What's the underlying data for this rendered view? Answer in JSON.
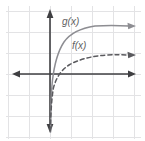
{
  "figure": {
    "width": 145,
    "height": 141,
    "background_color": "#ffffff"
  },
  "grid": {
    "visible": true,
    "color": "#e3e3e5",
    "spacing_px": 21,
    "x_lines": [
      8,
      29,
      50,
      71,
      92,
      113,
      134
    ],
    "y_lines": [
      11,
      32,
      53,
      74,
      95,
      116,
      137
    ]
  },
  "axes": {
    "color": "#3f3f42",
    "origin": {
      "x": 50,
      "y": 74
    },
    "x_axis": {
      "from_x": 12,
      "to_x": 136,
      "y": 74,
      "arrows": "both"
    },
    "y_axis": {
      "from_y": 8,
      "to_y": 132,
      "x": 50,
      "arrows": "both"
    },
    "tick_labels": []
  },
  "curves": [
    {
      "name": "g",
      "label": "g(x)",
      "label_x": 62,
      "label_y": 25,
      "style": "solid",
      "color": "#8d8d92",
      "arrow_end": "right",
      "description": "logarithmic curve, steep rise near x=0, flattening to the right",
      "path": "M 50.6 132 C 50.8 110, 51.2 92, 52.4 81 C 54.2 65, 58 51, 64 42 C 71 32, 82 28, 95 26 C 108 25, 120 25.4, 129 26"
    },
    {
      "name": "f",
      "label": "f(x)",
      "label_x": 72,
      "label_y": 49,
      "style": "dashed",
      "color": "#5a5a5e",
      "arrow_end": "right",
      "description": "logarithmic curve with smaller base-scale, shallower than g(x)",
      "path": "M 50.4 131 C 50.6 116, 51.4 100, 53.4 88 C 56 78, 61 70, 69 65 C 79 59, 93 56, 107 55 C 116 54.6, 124 54.8, 129 55"
    }
  ],
  "chart_data": {
    "type": "line",
    "title": "",
    "xlabel": "",
    "ylabel": "",
    "xlim": [
      -2,
      4
    ],
    "ylim": [
      -3,
      3
    ],
    "grid": true,
    "legend": "inline-labels",
    "series": [
      {
        "name": "g(x)",
        "style": "solid",
        "color": "#8d8d92",
        "x": [
          0.05,
          0.1,
          0.25,
          0.5,
          1,
          1.5,
          2,
          2.5,
          3,
          3.5,
          4
        ],
        "y": [
          -2.8,
          -2.2,
          -1.2,
          -0.6,
          0.0,
          0.4,
          0.6,
          0.8,
          0.95,
          1.05,
          1.15
        ]
      },
      {
        "name": "f(x)",
        "style": "dashed",
        "color": "#5a5a5e",
        "x": [
          0.05,
          0.1,
          0.25,
          0.5,
          1,
          1.5,
          2,
          2.5,
          3,
          3.5,
          4
        ],
        "y": [
          -2.6,
          -2.0,
          -1.0,
          -0.45,
          0.0,
          0.2,
          0.33,
          0.42,
          0.5,
          0.56,
          0.6
        ]
      }
    ],
    "annotations": [
      {
        "text": "g(x)",
        "x": 0.6,
        "y": 2.3
      },
      {
        "text": "f(x)",
        "x": 1.1,
        "y": 1.2
      }
    ]
  }
}
